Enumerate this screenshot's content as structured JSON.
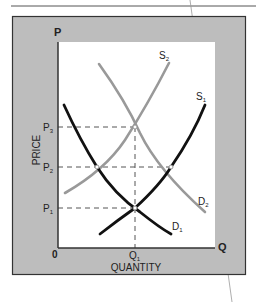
{
  "diagram": {
    "axes": {
      "y_letter": "P",
      "x_letter": "Q",
      "origin": "0",
      "y_title": "PRICE",
      "x_title": "QUANTITY"
    },
    "price_levels": [
      {
        "name": "P",
        "sub": "3"
      },
      {
        "name": "P",
        "sub": "2"
      },
      {
        "name": "P",
        "sub": "1"
      }
    ],
    "quantity_levels": [
      {
        "name": "Q",
        "sub": "1"
      }
    ],
    "curves": [
      {
        "name": "S",
        "sub": "2",
        "color": "#999999",
        "type": "supply"
      },
      {
        "name": "S",
        "sub": "1",
        "color": "#111111",
        "type": "supply"
      },
      {
        "name": "D",
        "sub": "2",
        "color": "#999999",
        "type": "demand"
      },
      {
        "name": "D",
        "sub": "1",
        "color": "#111111",
        "type": "demand"
      }
    ],
    "colors": {
      "frame_fill": "#bdbdbd",
      "plot_fill": "#ffffff",
      "original_curves": "#111111",
      "shifted_curves": "#999999",
      "guides": "#555555"
    }
  }
}
